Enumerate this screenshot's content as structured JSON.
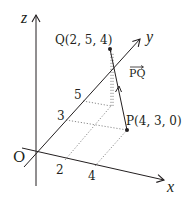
{
  "diagram": {
    "axes": {
      "x_label": "x",
      "y_label": "y",
      "z_label": "z",
      "origin_label": "O"
    },
    "ticks": {
      "x": [
        {
          "value": 2,
          "label": "2"
        },
        {
          "value": 4,
          "label": "4"
        }
      ],
      "y": [
        {
          "value": 3,
          "label": "3"
        },
        {
          "value": 5,
          "label": "5"
        }
      ]
    },
    "points": {
      "P": {
        "name": "P",
        "coords": [
          4,
          3,
          0
        ],
        "label": "P(4, 3, 0)"
      },
      "Q": {
        "name": "Q",
        "coords": [
          2,
          5,
          4
        ],
        "label": "Q(2, 5, 4)"
      }
    },
    "vector": {
      "from": "P",
      "to": "Q",
      "label": "PQ"
    },
    "colors": {
      "ink": "#231f20",
      "dotted": "#8a8a8a"
    }
  }
}
